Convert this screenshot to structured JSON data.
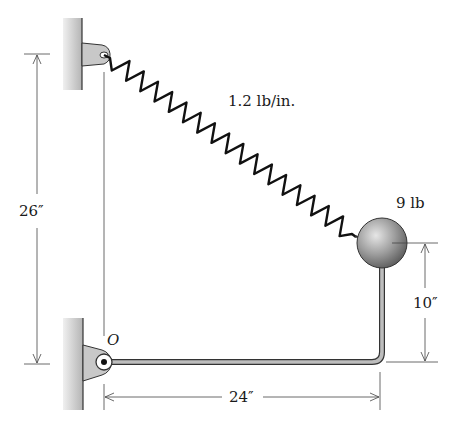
{
  "diagram": {
    "labels": {
      "spring_constant": "1.2 lb/in.",
      "ball_weight": "9 lb",
      "vertical_dim_left": "26″",
      "vertical_dim_right": "10″",
      "horizontal_dim": "24″",
      "pivot": "O"
    },
    "components": [
      "wall-top",
      "wall-bottom",
      "spring",
      "ball",
      "bent-rod",
      "pivot-O"
    ],
    "colors": {
      "line": "#333333",
      "wall": "#bdbdbd",
      "ball": "#9a9a9a",
      "rod": "#8a8a8a"
    }
  }
}
